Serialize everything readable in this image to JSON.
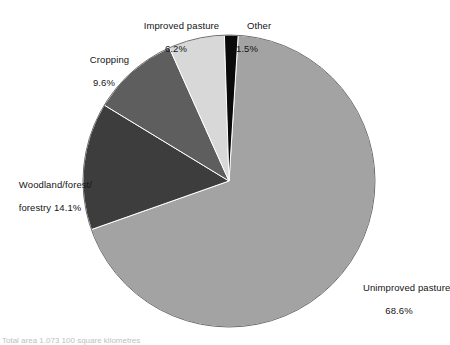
{
  "chart_data": {
    "type": "pie",
    "title": "",
    "subtitle": "",
    "xlabel": "",
    "ylabel": "",
    "legend_position": "none",
    "grid": false,
    "units": "percent",
    "categories": [
      "Unimproved pasture",
      "Woodland/forest/forestry",
      "Cropping",
      "Improved pasture",
      "Other"
    ],
    "values": [
      68.6,
      14.1,
      9.6,
      6.2,
      1.5
    ],
    "slices": [
      {
        "name": "Unimproved pasture",
        "label_line1": "Unimproved pasture",
        "label_line2": "68.6%",
        "value": 68.6,
        "color": "#a3a3a3",
        "start_angle": 3.6,
        "end_angle": 250.56
      },
      {
        "name": "Woodland/forest/forestry",
        "label_line1": "Woodland/forest/",
        "label_line2": "forestry 14.1%",
        "value": 14.1,
        "color": "#3d3d3d",
        "start_angle": 250.56,
        "end_angle": 301.32
      },
      {
        "name": "Cropping",
        "label_line1": "Cropping",
        "label_line2": "9.6%",
        "value": 9.6,
        "color": "#5e5e5e",
        "start_angle": 301.32,
        "end_angle": 335.88
      },
      {
        "name": "Improved pasture",
        "label_line1": "Improved pasture",
        "label_line2": "6.2%",
        "value": 6.2,
        "color": "#d8d8d8",
        "start_angle": 335.88,
        "end_angle": 358.2
      },
      {
        "name": "Other",
        "label_line1": "Other",
        "label_line2": "1.5%",
        "value": 1.5,
        "color": "#0a0a0a",
        "start_angle": 358.2,
        "end_angle": 363.6
      }
    ]
  },
  "geometry": {
    "center_x": 229,
    "center_y": 181,
    "radius": 146,
    "outline_color": "#6e6e6e"
  },
  "caption": {
    "text": "Total area 1.073 100 square kilometres"
  }
}
